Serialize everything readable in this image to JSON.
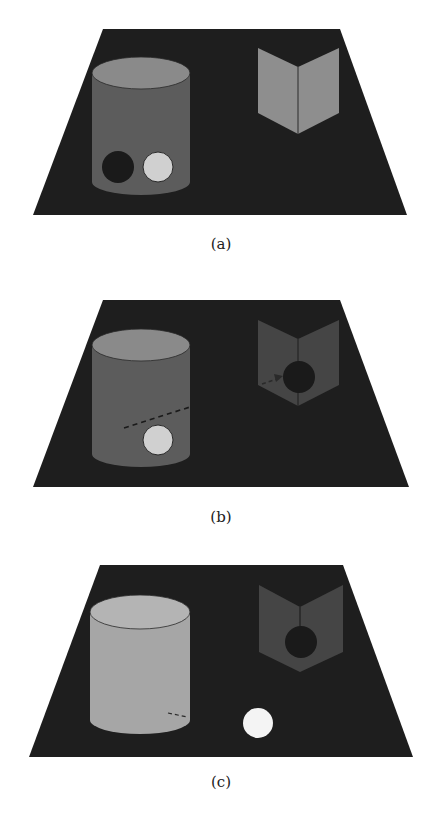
{
  "colors": {
    "background": "#ffffff",
    "floor": "#1e1e1e",
    "cylinder_a_side": "#5c5c5c",
    "cylinder_a_top": "#8a8a8a",
    "cylinder_c_side": "#a6a6a6",
    "cylinder_c_top": "#b4b4b4",
    "screen_bright": "#8e8e8e",
    "screen_dim": "#454545",
    "dark_ball": "#1a1a1a",
    "light_ball": "#d0d0d0",
    "white_ball": "#f4f4f4"
  },
  "panels": [
    {
      "id": "a",
      "caption": "(a)",
      "description": "Opaque cylinder occluding a dark ball and a light ball; bright two-panel screen on the right"
    },
    {
      "id": "b",
      "caption": "(b)",
      "description": "Dark ball travels along dashed trajectory from behind cylinder to behind the dimmed screen"
    },
    {
      "id": "c",
      "caption": "(c)",
      "description": "Cylinder becomes light; light ball now visible on the floor, dark ball behind screen"
    }
  ]
}
